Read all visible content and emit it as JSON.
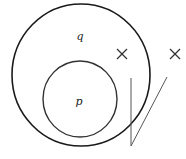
{
  "diagram": {
    "outer_circle": {
      "label": "q",
      "cx": 81,
      "cy": 75,
      "rx": 69,
      "ry": 71
    },
    "inner_circle": {
      "label": "p",
      "cx": 80,
      "cy": 99,
      "rx": 37,
      "ry": 38
    },
    "marks": [
      {
        "symbol": "×",
        "x": 122,
        "y": 54
      },
      {
        "symbol": "×",
        "x": 175,
        "y": 54
      }
    ],
    "check_lines": {
      "vertical": {
        "x1": 131,
        "y1": 78,
        "x2": 131,
        "y2": 146
      },
      "diagonal": {
        "x1": 131,
        "y1": 146,
        "x2": 167,
        "y2": 77
      }
    },
    "colors": {
      "stroke": "#1a1a1a",
      "line": "#555555"
    }
  }
}
